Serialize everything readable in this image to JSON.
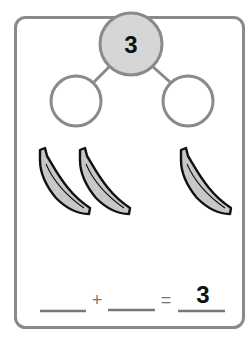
{
  "number_bond": {
    "whole": "3",
    "part_left": "",
    "part_right": ""
  },
  "objects": {
    "type": "banana-icon",
    "group_left_count": 2,
    "group_right_count": 1
  },
  "equation": {
    "addend_1": "",
    "plus": "+",
    "addend_2": "",
    "equals": "=",
    "sum": "3"
  },
  "colors": {
    "frame": "#8a8a8a",
    "whole_fill": "#d6d6d6",
    "banana_fill": "#c8c8c8",
    "outline": "#111111"
  }
}
